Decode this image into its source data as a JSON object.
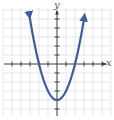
{
  "chart_data": {
    "type": "line",
    "title": "",
    "xlabel": "x",
    "ylabel": "y",
    "function": "y = x^2 - 4",
    "xlim": [
      -6,
      6
    ],
    "ylim": [
      -5,
      6
    ],
    "grid": true,
    "x_ticks": [
      -5,
      -4,
      -3,
      -2,
      -1,
      1,
      2,
      3,
      4,
      5
    ],
    "y_ticks": [
      -5,
      -4,
      -3,
      -2,
      -1,
      1,
      2,
      3,
      4,
      5
    ],
    "series": [
      {
        "name": "parabola",
        "x": [
          -3,
          -2.5,
          -2,
          -1.5,
          -1,
          -0.5,
          0,
          0.5,
          1,
          1.5,
          2,
          2.5,
          3
        ],
        "y": [
          5,
          2.25,
          0,
          -1.75,
          -3,
          -3.75,
          -4,
          -3.75,
          -3,
          -1.75,
          0,
          2.25,
          5
        ],
        "color": "#3f5f93"
      }
    ],
    "vertex": [
      0,
      -4
    ],
    "x_intercepts": [
      -2,
      2
    ],
    "y_intercept": -4,
    "ends_with_arrows": true
  },
  "axes": {
    "x_label": "x",
    "y_label": "y"
  },
  "colors": {
    "curve": "#3f5f93",
    "grid": "#d9dde3",
    "axis": "#333333"
  }
}
